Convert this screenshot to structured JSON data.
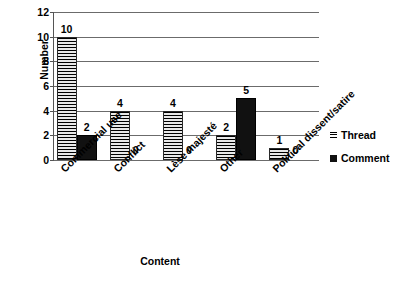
{
  "chart_data": {
    "type": "bar",
    "title": "",
    "xlabel": "Content",
    "ylabel": "Number",
    "ylim": [
      0,
      12
    ],
    "yticks": [
      0,
      2,
      4,
      6,
      8,
      10,
      12
    ],
    "grid": true,
    "legend_position": "right",
    "categories": [
      "Commercial use",
      "Conflict",
      "Lèse majesté",
      "Other",
      "Political dissent/satire"
    ],
    "series": [
      {
        "name": "Thread",
        "values": [
          10,
          4,
          4,
          2,
          1
        ]
      },
      {
        "name": "Comment",
        "values": [
          2,
          0,
          0,
          5,
          0
        ]
      }
    ],
    "data_labels": {
      "Thread": [
        "10",
        "4",
        "4",
        "2",
        "1"
      ],
      "Comment": [
        "2",
        "0",
        "0",
        "5",
        "0"
      ]
    }
  },
  "legend": {
    "items": [
      {
        "label": "Thread",
        "marker": "hatched-square-icon"
      },
      {
        "label": "Comment",
        "marker": "solid-square-icon"
      }
    ]
  },
  "axis": {
    "y_title": "Number",
    "x_title": "Content",
    "y_tick_labels": [
      "0",
      "2",
      "4",
      "6",
      "8",
      "10",
      "12"
    ]
  }
}
